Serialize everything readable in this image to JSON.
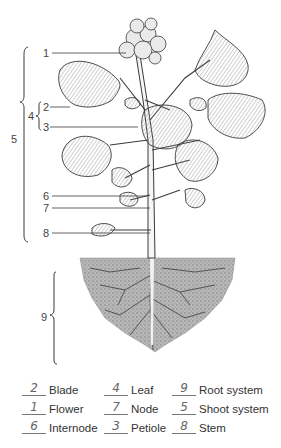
{
  "diagram": {
    "callouts": [
      {
        "number": "1",
        "part": "Flower"
      },
      {
        "number": "2",
        "part": "Blade"
      },
      {
        "number": "3",
        "part": "Petiole"
      },
      {
        "number": "4",
        "part": "Leaf"
      },
      {
        "number": "5",
        "part": "Shoot system"
      },
      {
        "number": "6",
        "part": "Internode"
      },
      {
        "number": "7",
        "part": "Node"
      },
      {
        "number": "8",
        "part": "Stem"
      },
      {
        "number": "9",
        "part": "Root system"
      }
    ]
  },
  "key": {
    "items": [
      {
        "answer": "2",
        "label": "Blade"
      },
      {
        "answer": "4",
        "label": "Leaf"
      },
      {
        "answer": "9",
        "label": "Root system"
      },
      {
        "answer": "1",
        "label": "Flower"
      },
      {
        "answer": "7",
        "label": "Node"
      },
      {
        "answer": "5",
        "label": "Shoot system"
      },
      {
        "answer": "6",
        "label": "Internode"
      },
      {
        "answer": "3",
        "label": "Petiole"
      },
      {
        "answer": "8",
        "label": "Stem"
      }
    ]
  },
  "colors": {
    "ink": "#3a3a3a",
    "leaf_shade": "#cfcfcf",
    "soil": "#a9a9a9",
    "handwriting": "#666666"
  }
}
